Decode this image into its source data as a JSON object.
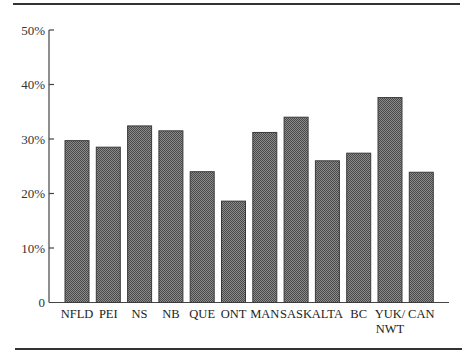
{
  "chart_data": {
    "type": "bar",
    "title": "",
    "xlabel": "",
    "ylabel": "",
    "ylim": [
      0,
      50
    ],
    "yticks": [
      0,
      10,
      20,
      30,
      40,
      50
    ],
    "ytick_labels": [
      "0",
      "10%",
      "20%",
      "30%",
      "40%",
      "50%"
    ],
    "grid": false,
    "legend": null,
    "categories": [
      "NFLD",
      "PEI",
      "NS",
      "NB",
      "QUE",
      "ONT",
      "MAN",
      "SASK",
      "ALTA",
      "BC",
      "YUK/NWT",
      "CAN"
    ],
    "category_label_lines": [
      [
        "NFLD"
      ],
      [
        "PEI"
      ],
      [
        "NS"
      ],
      [
        "NB"
      ],
      [
        "QUE"
      ],
      [
        "ONT"
      ],
      [
        "MAN"
      ],
      [
        "SASK"
      ],
      [
        "ALTA"
      ],
      [
        "BC"
      ],
      [
        "YUK/",
        "NWT"
      ],
      [
        "CAN"
      ]
    ],
    "values": [
      29.7,
      28.5,
      32.4,
      31.5,
      24.0,
      18.6,
      31.2,
      34.0,
      26.0,
      27.4,
      37.6,
      23.9
    ],
    "unit": "%",
    "colors": {
      "bar_fill": "#5e5e5e",
      "bar_fill_light": "#8a8a8a",
      "bar_edge": "#3a3a3a",
      "axis": "#444444",
      "rule": "#333333"
    }
  }
}
